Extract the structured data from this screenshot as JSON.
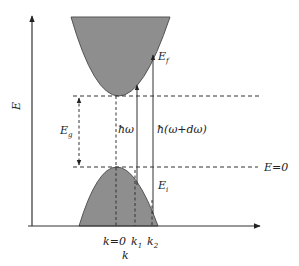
{
  "diagram": {
    "type": "band-structure",
    "axes": {
      "y_label": "E",
      "x_label": "k"
    },
    "x_ticks": [
      {
        "label": "k=0",
        "italic": "k",
        "rest": "=0"
      },
      {
        "label": "k1",
        "main": "k",
        "sub": "1"
      },
      {
        "label": "k2",
        "main": "k",
        "sub": "2"
      }
    ],
    "levels": {
      "band_gap": {
        "main": "E",
        "sub": "g"
      },
      "zero_level": "E=0",
      "zero_level_main": "E",
      "zero_level_rest": "=0"
    },
    "transitions": [
      {
        "name": "photon-energy",
        "label": "ħω"
      },
      {
        "name": "photon-energy-plus",
        "label": "ħ(ω+dω)"
      }
    ],
    "states": {
      "final": {
        "main": "E",
        "sub": "f"
      },
      "initial": {
        "main": "E",
        "sub": "i"
      }
    },
    "bands": [
      {
        "name": "conduction-band",
        "shape": "parabola-up"
      },
      {
        "name": "valence-band",
        "shape": "parabola-down"
      }
    ],
    "colors": {
      "band_fill": "#8e8e8e",
      "line": "#333333",
      "background": "#ffffff"
    }
  }
}
